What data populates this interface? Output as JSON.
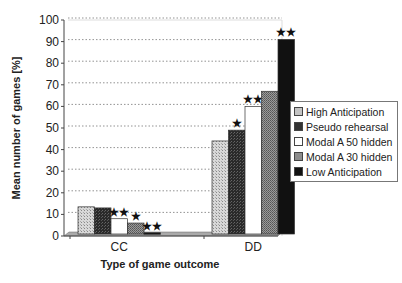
{
  "chart_data": {
    "type": "bar",
    "title": "",
    "xlabel": "Type of game outcome",
    "ylabel": "Mean number of games [%]",
    "ylim": [
      0,
      100
    ],
    "yticks": [
      0,
      10,
      20,
      30,
      40,
      50,
      60,
      70,
      80,
      90,
      100
    ],
    "grid": true,
    "legend_position": "right",
    "categories": [
      "CC",
      "DD"
    ],
    "series": [
      {
        "name": "High Anticipation",
        "values": [
          13.5,
          44
        ],
        "color": "#c8c8c8",
        "pattern": "dotted-light",
        "significance": [
          "",
          ""
        ]
      },
      {
        "name": "Pseudo rehearsal",
        "values": [
          13,
          49
        ],
        "color": "#3a3a3a",
        "pattern": "dark-check",
        "significance": [
          "",
          "*"
        ]
      },
      {
        "name": "Modal A 50 hidden",
        "values": [
          8,
          60
        ],
        "color": "#ffffff",
        "pattern": "white",
        "significance": [
          "**",
          "**"
        ]
      },
      {
        "name": "Modal A 30 hidden",
        "values": [
          6,
          67
        ],
        "color": "#8a8a8a",
        "pattern": "mid-check",
        "significance": [
          "*",
          ""
        ]
      },
      {
        "name": "Low Anticipation",
        "values": [
          1.5,
          91
        ],
        "color": "#111111",
        "pattern": "solid-black",
        "significance": [
          "**",
          "**"
        ]
      }
    ]
  },
  "labels": {
    "xlabel": "Type of game outcome",
    "ylabel": "Mean number of games [%]",
    "legend": [
      "High Anticipation",
      "Pseudo rehearsal",
      "Modal A 50 hidden",
      "Modal A 30 hidden",
      "Low Anticipation"
    ]
  }
}
